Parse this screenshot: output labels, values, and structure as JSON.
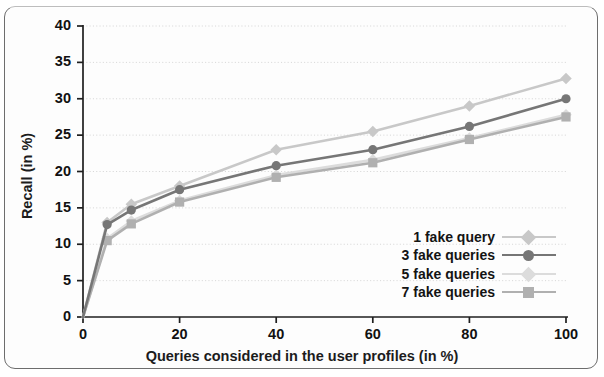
{
  "chart_data": {
    "type": "line",
    "title": "",
    "xlabel": "Queries considered in the user profiles (in %)",
    "ylabel": "Recall (in %)",
    "xlim": [
      0,
      100
    ],
    "ylim": [
      0,
      40
    ],
    "xticks": [
      0,
      20,
      40,
      60,
      80,
      100
    ],
    "yticks": [
      0,
      5,
      10,
      15,
      20,
      25,
      30,
      35,
      40
    ],
    "grid": "horizontal-dotted",
    "legend_position": "lower-right-inside",
    "x": [
      0,
      5,
      10,
      20,
      40,
      60,
      80,
      100
    ],
    "series": [
      {
        "name": "1 fake query",
        "marker": "diamond",
        "color": "#c8c8c8",
        "values": [
          0,
          13.0,
          15.5,
          18.0,
          23.0,
          25.5,
          29.0,
          32.8
        ]
      },
      {
        "name": "3 fake queries",
        "marker": "circle",
        "color": "#767676",
        "values": [
          0,
          12.7,
          14.7,
          17.5,
          20.8,
          23.0,
          26.2,
          30.0
        ]
      },
      {
        "name": "5 fake queries",
        "marker": "diamond",
        "color": "#dcdcdc",
        "values": [
          0,
          10.8,
          13.2,
          16.0,
          19.5,
          21.6,
          24.6,
          27.8
        ]
      },
      {
        "name": "7 fake queries",
        "marker": "square",
        "color": "#b0b0b0",
        "values": [
          0,
          10.5,
          12.8,
          15.8,
          19.2,
          21.2,
          24.4,
          27.5
        ]
      }
    ]
  },
  "figure": {
    "axis_color": "#1f1f1f",
    "grid_color": "#d8d8d8",
    "frame_color": "#6d6d6d",
    "background": "#fdfdfd"
  }
}
